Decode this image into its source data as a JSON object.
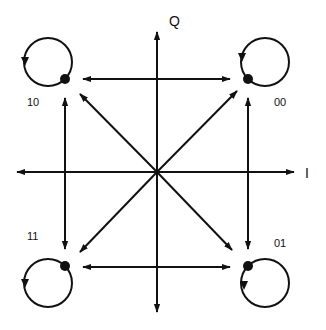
{
  "diagram": {
    "axes": {
      "horizontal_label": "I",
      "vertical_label": "Q"
    },
    "states": [
      {
        "id": "00",
        "label": "00",
        "quadrant": "upper-right"
      },
      {
        "id": "10",
        "label": "10",
        "quadrant": "upper-left"
      },
      {
        "id": "11",
        "label": "11",
        "quadrant": "lower-left"
      },
      {
        "id": "01",
        "label": "01",
        "quadrant": "lower-right"
      }
    ],
    "transitions": [
      {
        "from": "10",
        "to": "00",
        "type": "bidirectional"
      },
      {
        "from": "11",
        "to": "01",
        "type": "bidirectional"
      },
      {
        "from": "10",
        "to": "11",
        "type": "bidirectional"
      },
      {
        "from": "00",
        "to": "01",
        "type": "bidirectional"
      },
      {
        "from": "center",
        "to": "00",
        "type": "diagonal"
      },
      {
        "from": "center",
        "to": "10",
        "type": "diagonal"
      },
      {
        "from": "center",
        "to": "11",
        "type": "diagonal"
      },
      {
        "from": "center",
        "to": "01",
        "type": "diagonal"
      },
      {
        "from": "00",
        "to": "00",
        "type": "self-loop"
      },
      {
        "from": "10",
        "to": "10",
        "type": "self-loop"
      },
      {
        "from": "11",
        "to": "11",
        "type": "self-loop"
      },
      {
        "from": "01",
        "to": "01",
        "type": "self-loop"
      }
    ],
    "colors": {
      "stroke": "#111111",
      "background": "#ffffff"
    }
  }
}
